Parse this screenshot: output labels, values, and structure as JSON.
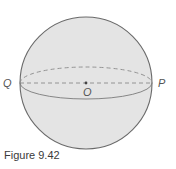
{
  "figure": {
    "caption": "Figure 9.42",
    "labels": {
      "left_point": "Q",
      "right_point": "P",
      "center_point": "O"
    },
    "colors": {
      "sphere_fill": "#e4e4e4",
      "sphere_stroke": "#6a6a6a",
      "equator_stroke": "#7a7a7a",
      "dashed_stroke": "#8a8a8a",
      "center_dot": "#444444",
      "label_color": "#555555",
      "caption_color": "#3a3a3a"
    },
    "geometry": {
      "center": [
        86,
        83
      ],
      "radius": 66,
      "equator_ry": 16
    }
  }
}
